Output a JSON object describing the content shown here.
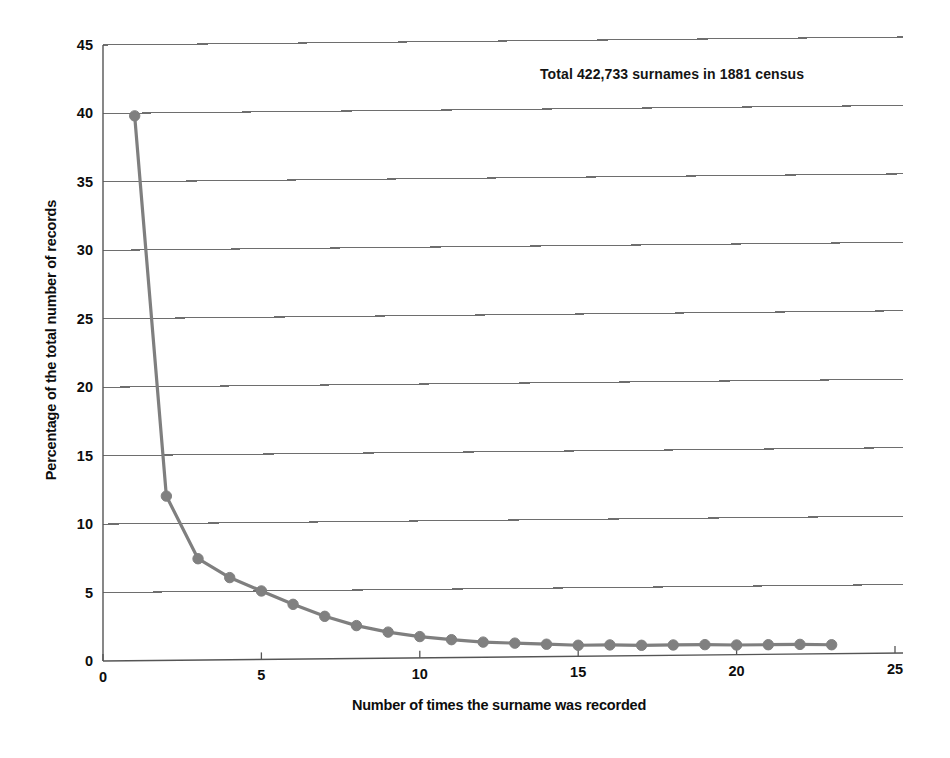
{
  "chart_data": {
    "type": "line",
    "title": "",
    "subtitle": "",
    "xlabel": "Number of times  the surname was recorded",
    "ylabel": "Percentage of the total number of records",
    "annotation": "Total  422,733 surnames  in 1881 census",
    "x": [
      1,
      2,
      3,
      4,
      5,
      6,
      7,
      8,
      9,
      10,
      11,
      12,
      13,
      14,
      15,
      16,
      17,
      18,
      19,
      20,
      21,
      22,
      23
    ],
    "values": [
      39.8,
      12.0,
      7.4,
      6.0,
      5.0,
      4.0,
      3.1,
      2.4,
      1.9,
      1.55,
      1.3,
      1.1,
      1.0,
      0.9,
      0.8,
      0.8,
      0.75,
      0.75,
      0.75,
      0.7,
      0.7,
      0.7,
      0.65
    ],
    "series": [
      {
        "name": "Percentage of the total number of records",
        "values": [
          39.8,
          12.0,
          7.4,
          6.0,
          5.0,
          4.0,
          3.1,
          2.4,
          1.9,
          1.55,
          1.3,
          1.1,
          1.0,
          0.9,
          0.8,
          0.8,
          0.75,
          0.75,
          0.75,
          0.7,
          0.7,
          0.7,
          0.65
        ]
      }
    ],
    "xlim": [
      0,
      25
    ],
    "ylim": [
      0,
      45
    ],
    "xticks": [
      "0",
      "5",
      "10",
      "15",
      "20",
      "25"
    ],
    "xtick_values": [
      0,
      5,
      10,
      15,
      20,
      25
    ],
    "yticks": [
      "0",
      "5",
      "10",
      "15",
      "20",
      "25",
      "30",
      "35",
      "40",
      "45"
    ],
    "ytick_values": [
      0,
      5,
      10,
      15,
      20,
      25,
      30,
      35,
      40,
      45
    ],
    "grid": "horizontal",
    "legend": "none",
    "line_color": "#7f7f7f",
    "marker_color": "#808080",
    "marker_shape": "circle",
    "axis_color": "#555555",
    "grid_color": "#6e6e6e",
    "background": "#ffffff"
  }
}
